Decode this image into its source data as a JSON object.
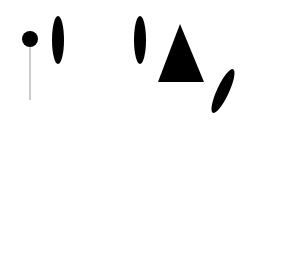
{
  "diagram": {
    "light_source_label_line1": "Licht-",
    "light_source_label_line2": "quelle",
    "lens1": {
      "base": "L",
      "sub": "1"
    },
    "slit1": {
      "base": "S",
      "sub": "1"
    },
    "lens2": {
      "base": "L",
      "sub": "2"
    },
    "lens3": {
      "base": "L",
      "sub": "3"
    },
    "screen_label": "B",
    "exit_slit_lambda2": {
      "base": "S",
      "sub": "2",
      "suffix": "(λ",
      "suffix_sub": "2",
      "close": ")"
    },
    "exit_slit_lambda1": {
      "base": "S",
      "sub": "2",
      "suffix": "(λ",
      "suffix_sub": "1",
      "close": ")"
    },
    "panel_a_label": "a)",
    "panel_b_label": "b)",
    "colors": {
      "source": "#f07060",
      "ray_red": "#d9857a",
      "ray_dark": "#444444",
      "optics": "#5f5f5f",
      "slit": "#111111"
    }
  },
  "spectrum": {
    "axis_unit": "nm",
    "ticks": [
      390,
      392,
      394,
      396,
      398
    ],
    "range_nm": [
      389.8,
      398.3
    ],
    "lines": [
      {
        "nm": 390.0,
        "i": 0.9
      },
      {
        "nm": 390.05,
        "i": 0.6
      },
      {
        "nm": 390.25,
        "i": 0.5
      },
      {
        "nm": 390.35,
        "i": 0.4
      },
      {
        "nm": 390.6,
        "i": 0.7
      },
      {
        "nm": 390.7,
        "i": 0.9
      },
      {
        "nm": 390.8,
        "i": 1.0
      },
      {
        "nm": 390.85,
        "i": 1.0
      },
      {
        "nm": 390.95,
        "i": 0.8
      },
      {
        "nm": 391.05,
        "i": 0.9
      },
      {
        "nm": 391.15,
        "i": 0.6
      },
      {
        "nm": 391.25,
        "i": 0.4
      },
      {
        "nm": 391.45,
        "i": 0.5
      },
      {
        "nm": 391.55,
        "i": 0.3
      },
      {
        "nm": 391.95,
        "i": 1.0
      },
      {
        "nm": 392.0,
        "i": 0.8
      },
      {
        "nm": 392.25,
        "i": 0.5
      },
      {
        "nm": 392.4,
        "i": 0.6
      },
      {
        "nm": 392.55,
        "i": 0.7
      },
      {
        "nm": 392.65,
        "i": 0.6
      },
      {
        "nm": 392.75,
        "i": 0.8
      },
      {
        "nm": 392.85,
        "i": 0.5
      },
      {
        "nm": 393.0,
        "i": 0.4
      },
      {
        "nm": 393.15,
        "i": 0.6
      },
      {
        "nm": 393.3,
        "i": 0.5
      },
      {
        "nm": 393.55,
        "i": 0.6
      },
      {
        "nm": 393.75,
        "i": 0.4
      },
      {
        "nm": 393.85,
        "i": 0.5
      },
      {
        "nm": 394.0,
        "i": 0.4
      },
      {
        "nm": 394.2,
        "i": 0.9
      },
      {
        "nm": 394.4,
        "i": 1.0
      },
      {
        "nm": 394.55,
        "i": 0.6
      },
      {
        "nm": 394.8,
        "i": 0.9
      },
      {
        "nm": 394.95,
        "i": 1.0
      },
      {
        "nm": 395.1,
        "i": 0.8
      },
      {
        "nm": 395.25,
        "i": 0.6
      },
      {
        "nm": 395.9,
        "i": 0.4
      },
      {
        "nm": 396.25,
        "i": 0.5
      },
      {
        "nm": 396.4,
        "i": 0.5
      },
      {
        "nm": 396.7,
        "i": 0.6
      },
      {
        "nm": 396.85,
        "i": 1.0
      },
      {
        "nm": 397.2,
        "i": 0.7
      },
      {
        "nm": 397.3,
        "i": 1.0
      },
      {
        "nm": 397.7,
        "i": 1.0
      }
    ]
  }
}
